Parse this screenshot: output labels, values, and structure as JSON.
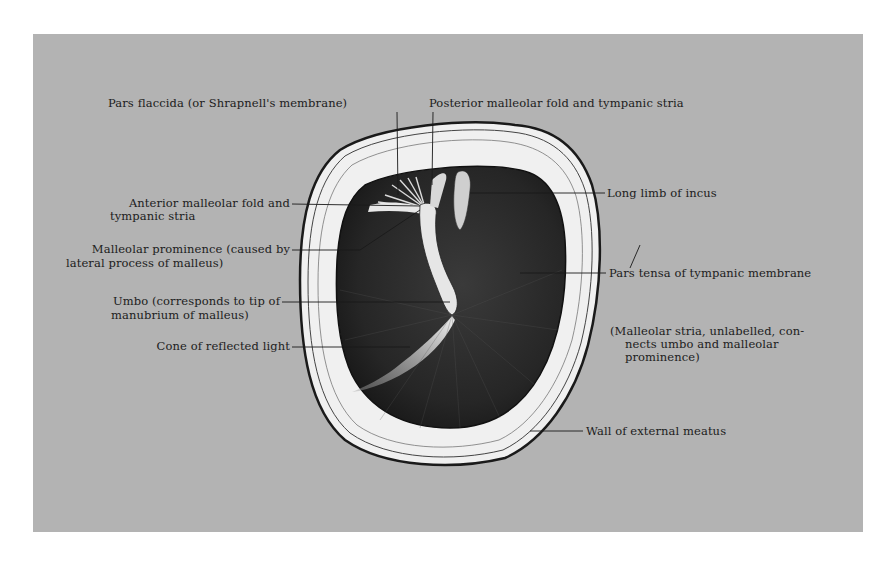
{
  "figure": {
    "background_color": "#b3b3b3",
    "labels": {
      "pars_flaccida": "Pars flaccida (or Shrapnell's membrane)",
      "posterior_fold": "Posterior malleolar fold and tympanic stria",
      "anterior_fold_line1": "Anterior malleolar fold and",
      "anterior_fold_line2": "tympanic stria",
      "malleolar_prominence_line1": "Malleolar prominence (caused by",
      "malleolar_prominence_line2": "lateral process of malleus)",
      "umbo_line1": "Umbo (corresponds to tip of",
      "umbo_line2": "manubrium of malleus)",
      "cone_of_light": "Cone of reflected light",
      "long_limb_incus": "Long limb of incus",
      "pars_tensa": "Pars tensa of tympanic membrane",
      "malleolar_stria_line1": "(Malleolar stria, unlabelled, con-",
      "malleolar_stria_line2": "nects umbo and malleolar",
      "malleolar_stria_line3": "prominence)",
      "wall_meatus": "Wall of external meatus"
    }
  }
}
